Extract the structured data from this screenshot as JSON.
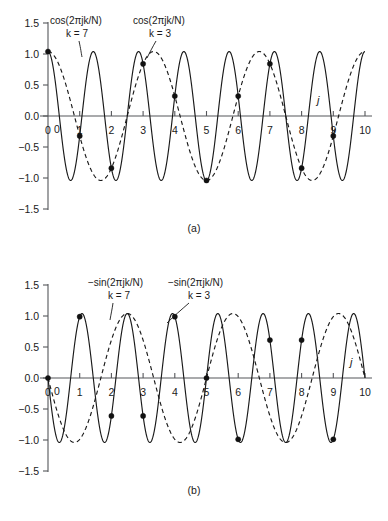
{
  "figure": {
    "background": "#ffffff",
    "ink": "#1a1a1a",
    "axis_color": "#55565a"
  },
  "panels": [
    {
      "id": "a",
      "caption": "(a)",
      "axis_variable": "j",
      "y_ticks": [
        "1.5",
        "1.0",
        "0.5",
        "0.0",
        "-0.5",
        "-1.0",
        "-1.5"
      ],
      "x_ticks": [
        "0",
        "1",
        "2",
        "3",
        "4",
        "5",
        "6",
        "7",
        "8",
        "9",
        "10"
      ],
      "origin_label": "0",
      "annotations": [
        {
          "expr": "cos(2πjk/N)",
          "k_label": "k = 7",
          "style": "solid"
        },
        {
          "expr": "cos(2πjk/N)",
          "k_label": "k = 3",
          "style": "dashed"
        }
      ]
    },
    {
      "id": "b",
      "caption": "(b)",
      "axis_variable": "j",
      "y_ticks": [
        "1.5",
        "1.0",
        "0.5",
        "0.0",
        "-0.5",
        "-1.0",
        "-1.5"
      ],
      "x_ticks": [
        "0",
        "1",
        "2",
        "3",
        "4",
        "5",
        "6",
        "7",
        "8",
        "9",
        "10"
      ],
      "origin_label": "0",
      "annotations": [
        {
          "expr": "−sin(2πjk/N)",
          "k_label": "k = 7",
          "style": "solid"
        },
        {
          "expr": "−sin(2πjk/N)",
          "k_label": "k = 3",
          "style": "dashed"
        }
      ]
    }
  ],
  "chart_data": [
    {
      "type": "line",
      "title": "(a)",
      "xlabel": "j",
      "ylabel": "",
      "xlim": [
        0,
        10
      ],
      "ylim": [
        -1.5,
        1.5
      ],
      "grid": false,
      "legend": "inline-annotations",
      "xticks": [
        0,
        1,
        2,
        3,
        4,
        5,
        6,
        7,
        8,
        9,
        10
      ],
      "yticks": [
        -1.5,
        -1.0,
        -0.5,
        0.0,
        0.5,
        1.0,
        1.5
      ],
      "N": 10,
      "series": [
        {
          "name": "cos(2πjk/N), k = 7",
          "style": "solid",
          "formula": "cos(2*pi*j*7/10)",
          "k": 7
        },
        {
          "name": "cos(2πjk/N), k = 3",
          "style": "dashed",
          "formula": "cos(2*pi*j*3/10)",
          "k": 3
        }
      ],
      "sample_markers": {
        "x": [
          0,
          1,
          2,
          3,
          4,
          5,
          6,
          7,
          8,
          9
        ],
        "y": [
          1.0,
          -0.309,
          -0.809,
          0.809,
          0.309,
          -1.0,
          0.309,
          0.809,
          -0.809,
          -0.309
        ],
        "note": "samples coincide for k = 7 and k = 3"
      }
    },
    {
      "type": "line",
      "title": "(b)",
      "xlabel": "j",
      "ylabel": "",
      "xlim": [
        0,
        10
      ],
      "ylim": [
        -1.5,
        1.5
      ],
      "grid": false,
      "legend": "inline-annotations",
      "xticks": [
        0,
        1,
        2,
        3,
        4,
        5,
        6,
        7,
        8,
        9,
        10
      ],
      "yticks": [
        -1.5,
        -1.0,
        -0.5,
        0.0,
        0.5,
        1.0,
        1.5
      ],
      "N": 10,
      "series": [
        {
          "name": "−sin(2πjk/N), k = 7",
          "style": "solid",
          "formula": "-sin(2*pi*j*7/10)",
          "k": 7
        },
        {
          "name": "−sin(2πjk/N), k = 3",
          "style": "dashed",
          "formula": "-sin(2*pi*j*3/10)",
          "k": 3
        }
      ],
      "sample_markers": {
        "x": [
          0,
          1,
          2,
          3,
          4,
          5,
          6,
          7,
          8,
          9
        ],
        "y": [
          0.0,
          0.951,
          -0.588,
          -0.588,
          0.951,
          0.0,
          -0.951,
          0.588,
          0.588,
          -0.951
        ],
        "note": "markers shown on the k = 7 solid trace sample values"
      }
    }
  ]
}
